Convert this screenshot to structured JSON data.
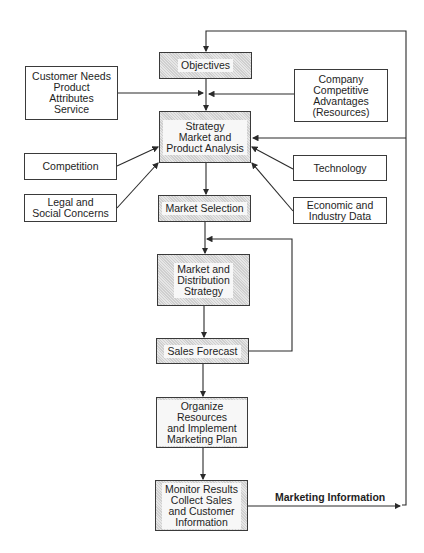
{
  "diagram": {
    "nodes": {
      "objectives": "Objectives",
      "customer_needs": "Customer Needs\nProduct\nAttributes\nService",
      "company_advantages": "Company\nCompetitive\nAdvantages\n(Resources)",
      "strategy": "Strategy\nMarket and\nProduct Analysis",
      "competition": "Competition",
      "technology": "Technology",
      "legal": "Legal and\nSocial Concerns",
      "economic": "Economic and\nIndustry Data",
      "market_selection": "Market Selection",
      "market_distribution": "Market and\nDistribution\nStrategy",
      "sales_forecast": "Sales Forecast",
      "organize": "Organize Resources\nand Implement\nMarketing Plan",
      "monitor": "Monitor Results\nCollect Sales\nand Customer\nInformation"
    },
    "edge_labels": {
      "marketing_information": "Marketing Information"
    },
    "edges": [
      {
        "from": "objectives",
        "to": "strategy"
      },
      {
        "from": "customer_needs",
        "to": "strategy"
      },
      {
        "from": "company_advantages",
        "to": "strategy"
      },
      {
        "from": "competition",
        "to": "strategy"
      },
      {
        "from": "legal",
        "to": "strategy"
      },
      {
        "from": "technology",
        "to": "strategy"
      },
      {
        "from": "economic",
        "to": "strategy"
      },
      {
        "from": "strategy",
        "to": "market_selection"
      },
      {
        "from": "market_selection",
        "to": "market_distribution"
      },
      {
        "from": "market_distribution",
        "to": "sales_forecast"
      },
      {
        "from": "sales_forecast",
        "to": "market_distribution",
        "type": "feedback"
      },
      {
        "from": "sales_forecast",
        "to": "organize"
      },
      {
        "from": "organize",
        "to": "monitor"
      },
      {
        "from": "monitor",
        "to": "objectives",
        "label": "Marketing Information",
        "type": "feedback"
      },
      {
        "from": "monitor",
        "to": "strategy",
        "type": "feedback"
      }
    ]
  }
}
